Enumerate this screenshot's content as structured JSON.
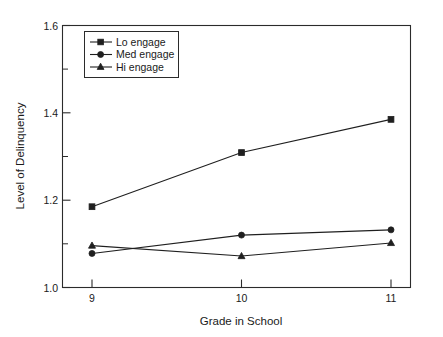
{
  "chart_data": {
    "type": "line",
    "title": "",
    "xlabel": "Grade in School",
    "ylabel": "Level of Delinquency",
    "categories": [
      "9",
      "10",
      "11"
    ],
    "x": [
      9,
      10,
      11
    ],
    "xlim": [
      8.6,
      11.4
    ],
    "ylim": [
      1.0,
      1.6
    ],
    "grid": false,
    "legend_position": "top-left",
    "y_ticks_major": [
      "1.0",
      "1.2",
      "1.4",
      "1.6"
    ],
    "y_tick_values_major": [
      1.0,
      1.2,
      1.4,
      1.6
    ],
    "y_tick_values_minor": [
      1.1,
      1.3,
      1.5
    ],
    "x_tick_labels": [
      "9",
      "10",
      "11"
    ],
    "series": [
      {
        "name": "Lo engage",
        "marker": "square",
        "values": [
          1.185,
          1.309,
          1.385
        ]
      },
      {
        "name": "Med engage",
        "marker": "circle",
        "values": [
          1.078,
          1.12,
          1.132
        ]
      },
      {
        "name": "Hi engage",
        "marker": "triangle",
        "values": [
          1.096,
          1.072,
          1.102
        ]
      }
    ]
  },
  "legend": {
    "entries": [
      {
        "label": "Lo engage",
        "marker": "square"
      },
      {
        "label": "Med engage",
        "marker": "circle"
      },
      {
        "label": "Hi engage",
        "marker": "triangle"
      }
    ]
  },
  "colors": {
    "ink": "#1f1f1f",
    "frame": "#2b2b2b",
    "background": "#ffffff"
  }
}
